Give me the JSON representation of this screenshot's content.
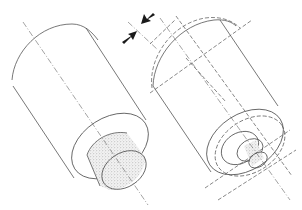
{
  "diagram": {
    "type": "technical line drawing",
    "figures": [
      {
        "id": "left",
        "description": "cylinder with stippled cylindrical core at front face, centered axis line"
      },
      {
        "id": "right",
        "description": "cylinder with dashed displaced outline, stepped stippled core, offset axis lines"
      }
    ],
    "arrows": {
      "count": 2,
      "description": "pair of opposing arrows indicating offset between axes"
    },
    "colors": {
      "line": "#555555",
      "fill": "#d9d9d9",
      "arrow": "#1a1a1a",
      "background": "#ffffff"
    }
  }
}
